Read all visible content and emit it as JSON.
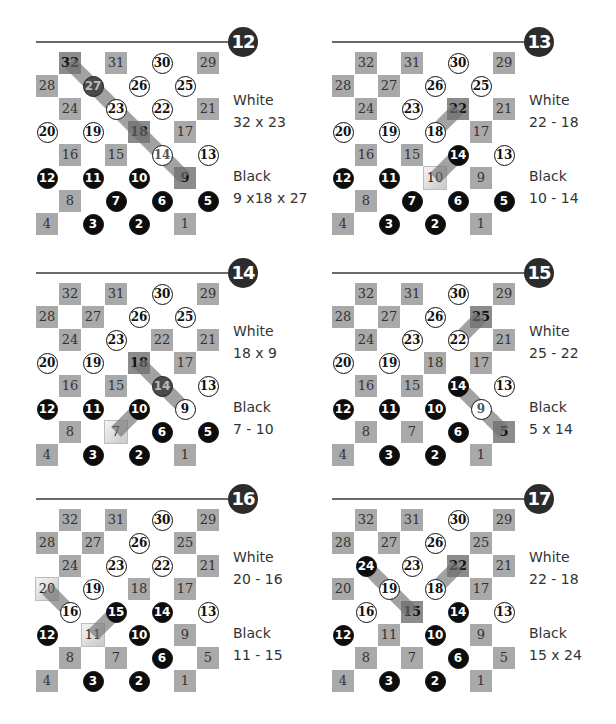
{
  "board_layout": {
    "rows": [
      [
        [
          1,
          32
        ],
        [
          3,
          31
        ],
        [
          5,
          30
        ],
        [
          7,
          29
        ]
      ],
      [
        [
          0,
          28
        ],
        [
          2,
          27
        ],
        [
          4,
          26
        ],
        [
          6,
          25
        ]
      ],
      [
        [
          1,
          24
        ],
        [
          3,
          23
        ],
        [
          5,
          22
        ],
        [
          7,
          21
        ]
      ],
      [
        [
          0,
          20
        ],
        [
          2,
          19
        ],
        [
          4,
          18
        ],
        [
          6,
          17
        ]
      ],
      [
        [
          1,
          16
        ],
        [
          3,
          15
        ],
        [
          5,
          14
        ],
        [
          7,
          13
        ]
      ],
      [
        [
          0,
          12
        ],
        [
          2,
          11
        ],
        [
          4,
          10
        ],
        [
          6,
          9
        ]
      ],
      [
        [
          1,
          8
        ],
        [
          3,
          7
        ],
        [
          5,
          6
        ],
        [
          7,
          5
        ]
      ],
      [
        [
          0,
          4
        ],
        [
          2,
          3
        ],
        [
          4,
          2
        ],
        [
          6,
          1
        ]
      ]
    ]
  },
  "diagrams": [
    {
      "number": "12",
      "white_label": "White",
      "white_move": "32 x 23",
      "black_label": "Black",
      "black_move": "9 x18 x 27",
      "white": [
        30,
        26,
        25,
        23,
        22,
        20,
        19,
        13
      ],
      "captured_white": [
        14
      ],
      "black": [
        12,
        11,
        10,
        7,
        6,
        5,
        3,
        2
      ],
      "captured_black": [
        27
      ],
      "highlight_bold": [
        32,
        18,
        9
      ],
      "highlight_light": [],
      "paths": [
        [
          32,
          27,
          23,
          18,
          14,
          9
        ]
      ]
    },
    {
      "number": "13",
      "white_label": "White",
      "white_move": "22 - 18",
      "black_label": "Black",
      "black_move": "10 - 14",
      "white": [
        30,
        26,
        25,
        23,
        20,
        19,
        18,
        13
      ],
      "captured_white": [],
      "black": [
        14,
        12,
        11,
        7,
        6,
        5,
        3,
        2
      ],
      "captured_black": [],
      "highlight_bold": [
        22
      ],
      "highlight_light": [
        10
      ],
      "paths": [
        [
          22,
          18
        ],
        [
          10,
          14
        ]
      ]
    },
    {
      "number": "14",
      "white_label": "White",
      "white_move": "18 x 9",
      "black_label": "Black",
      "black_move": "7 - 10",
      "white": [
        30,
        26,
        25,
        23,
        20,
        19,
        13,
        9
      ],
      "captured_white": [],
      "black": [
        12,
        11,
        10,
        6,
        5,
        3,
        2
      ],
      "captured_black": [
        14
      ],
      "highlight_bold": [
        18
      ],
      "highlight_light": [
        7
      ],
      "paths": [
        [
          18,
          14,
          9
        ],
        [
          7,
          10
        ]
      ]
    },
    {
      "number": "15",
      "white_label": "White",
      "white_move": "25 - 22",
      "black_label": "Black",
      "black_move": "5 x 14",
      "white": [
        30,
        26,
        23,
        22,
        20,
        19,
        13
      ],
      "captured_white": [
        9
      ],
      "black": [
        14,
        12,
        11,
        10,
        6,
        3,
        2
      ],
      "captured_black": [],
      "highlight_bold": [
        25,
        5
      ],
      "highlight_light": [],
      "paths": [
        [
          25,
          22
        ],
        [
          5,
          9,
          14
        ]
      ]
    },
    {
      "number": "16",
      "white_label": "White",
      "white_move": "20 - 16",
      "black_label": "Black",
      "black_move": "11 - 15",
      "white": [
        30,
        26,
        23,
        22,
        19,
        16,
        13
      ],
      "captured_white": [],
      "black": [
        15,
        14,
        12,
        10,
        6,
        3,
        2
      ],
      "captured_black": [],
      "highlight_bold": [],
      "highlight_light": [
        20,
        11
      ],
      "paths": [
        [
          20,
          16
        ],
        [
          11,
          15
        ]
      ]
    },
    {
      "number": "17",
      "white_label": "White",
      "white_move": "22 - 18",
      "black_label": "Black",
      "black_move": "15 x 24",
      "white": [
        30,
        26,
        23,
        19,
        18,
        16,
        13
      ],
      "captured_white": [],
      "black": [
        24,
        14,
        12,
        10,
        6,
        3,
        2
      ],
      "captured_black": [],
      "highlight_bold": [
        22,
        15
      ],
      "highlight_light": [],
      "paths": [
        [
          22,
          18
        ],
        [
          15,
          19,
          24
        ]
      ]
    }
  ],
  "colors": {
    "square": "#a9a9a9",
    "black_piece": "#0d0d0d",
    "white_piece": "#ffffff",
    "badge": "#2c2c2c",
    "rule": "#6a6a6a",
    "path": "#707070"
  }
}
